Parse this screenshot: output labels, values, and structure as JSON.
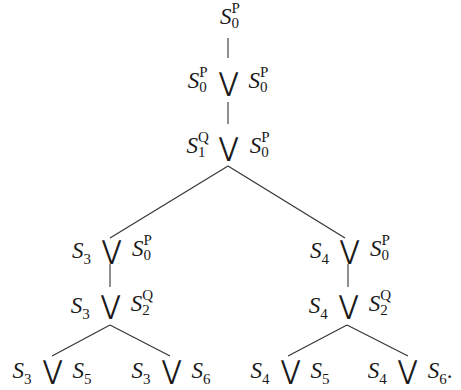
{
  "diagram": {
    "type": "tree",
    "operator_symbol": "⋁",
    "nodes": {
      "n1": {
        "left": {
          "base": "S",
          "sub": "0",
          "sup": "P"
        }
      },
      "n2": {
        "left": {
          "base": "S",
          "sub": "0",
          "sup": "P"
        },
        "right": {
          "base": "S",
          "sub": "0",
          "sup": "P"
        }
      },
      "n3": {
        "left": {
          "base": "S",
          "sub": "1",
          "sup": "Q"
        },
        "right": {
          "base": "S",
          "sub": "0",
          "sup": "P"
        }
      },
      "n4l": {
        "left": {
          "base": "S",
          "sub": "3"
        },
        "right": {
          "base": "S",
          "sub": "0",
          "sup": "P"
        }
      },
      "n4r": {
        "left": {
          "base": "S",
          "sub": "4"
        },
        "right": {
          "base": "S",
          "sub": "0",
          "sup": "P"
        }
      },
      "n5l": {
        "left": {
          "base": "S",
          "sub": "3"
        },
        "right": {
          "base": "S",
          "sub": "2",
          "sup": "Q"
        }
      },
      "n5r": {
        "left": {
          "base": "S",
          "sub": "4"
        },
        "right": {
          "base": "S",
          "sub": "2",
          "sup": "Q"
        }
      },
      "leaf1": {
        "left": {
          "base": "S",
          "sub": "3"
        },
        "right": {
          "base": "S",
          "sub": "5"
        }
      },
      "leaf2": {
        "left": {
          "base": "S",
          "sub": "3"
        },
        "right": {
          "base": "S",
          "sub": "6"
        }
      },
      "leaf3": {
        "left": {
          "base": "S",
          "sub": "4"
        },
        "right": {
          "base": "S",
          "sub": "5"
        }
      },
      "leaf4": {
        "left": {
          "base": "S",
          "sub": "4"
        },
        "right": {
          "base": "S",
          "sub": "6"
        },
        "trailing": "."
      }
    },
    "edges": [
      [
        "n1",
        "n2"
      ],
      [
        "n2",
        "n3"
      ],
      [
        "n3",
        "n4l"
      ],
      [
        "n3",
        "n4r"
      ],
      [
        "n4l",
        "n5l"
      ],
      [
        "n4r",
        "n5r"
      ],
      [
        "n5l",
        "leaf1"
      ],
      [
        "n5l",
        "leaf2"
      ],
      [
        "n5r",
        "leaf3"
      ],
      [
        "n5r",
        "leaf4"
      ]
    ]
  }
}
